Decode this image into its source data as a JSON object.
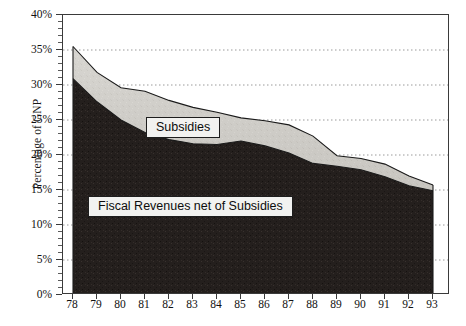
{
  "chart_data": {
    "type": "area",
    "stacked": true,
    "title": "",
    "xlabel": "",
    "ylabel": "Percentage of GNP",
    "categories": [
      "78",
      "79",
      "80",
      "81",
      "82",
      "83",
      "84",
      "85",
      "86",
      "87",
      "88",
      "89",
      "90",
      "91",
      "92",
      "93"
    ],
    "x_tick_labels": [
      "78",
      "79",
      "80",
      "81",
      "82",
      "83",
      "84",
      "85",
      "86",
      "87",
      "88",
      "89",
      "90",
      "91",
      "92",
      "93"
    ],
    "y_tick_labels": [
      "0%",
      "5%",
      "10%",
      "15%",
      "20%",
      "25%",
      "30%",
      "35%",
      "40%"
    ],
    "y_tick_values": [
      0,
      5,
      10,
      15,
      20,
      25,
      30,
      35,
      40
    ],
    "ylim": [
      0,
      40
    ],
    "grid": "horizontal-dotted",
    "legend_position": "inline-annotation",
    "series": [
      {
        "name": "Fiscal Revenues net of Subsidies",
        "color": "#241f1d",
        "values": [
          30.9,
          27.6,
          25.0,
          23.2,
          22.2,
          21.6,
          21.5,
          22.0,
          21.3,
          20.3,
          18.8,
          18.4,
          17.9,
          16.9,
          15.6,
          14.9
        ]
      },
      {
        "name": "Subsidies",
        "color": "#cfcdc8",
        "values": [
          4.6,
          4.2,
          4.6,
          5.9,
          5.6,
          5.2,
          4.6,
          3.3,
          3.6,
          4.0,
          3.9,
          1.5,
          1.6,
          1.8,
          1.4,
          0.8
        ]
      }
    ],
    "totals": [
      35.5,
      31.8,
      29.6,
      29.1,
      27.8,
      26.8,
      26.1,
      25.3,
      24.9,
      24.3,
      22.7,
      19.9,
      19.5,
      18.7,
      17.0,
      15.7
    ]
  },
  "annotations": {
    "subsidies_label": "Subsidies",
    "fiscal_label": "Fiscal Revenues net of Subsidies"
  },
  "axis": {
    "y_title": "Percentage of GNP"
  },
  "colors": {
    "dark_series": "#241f1d",
    "light_series": "#cfcdc8",
    "frame": "#3a3a3a",
    "grid": "#9a9a9a",
    "text": "#111111",
    "label_box_fill": "#f2f2f0",
    "label_box_border": "#1d1d1d"
  }
}
